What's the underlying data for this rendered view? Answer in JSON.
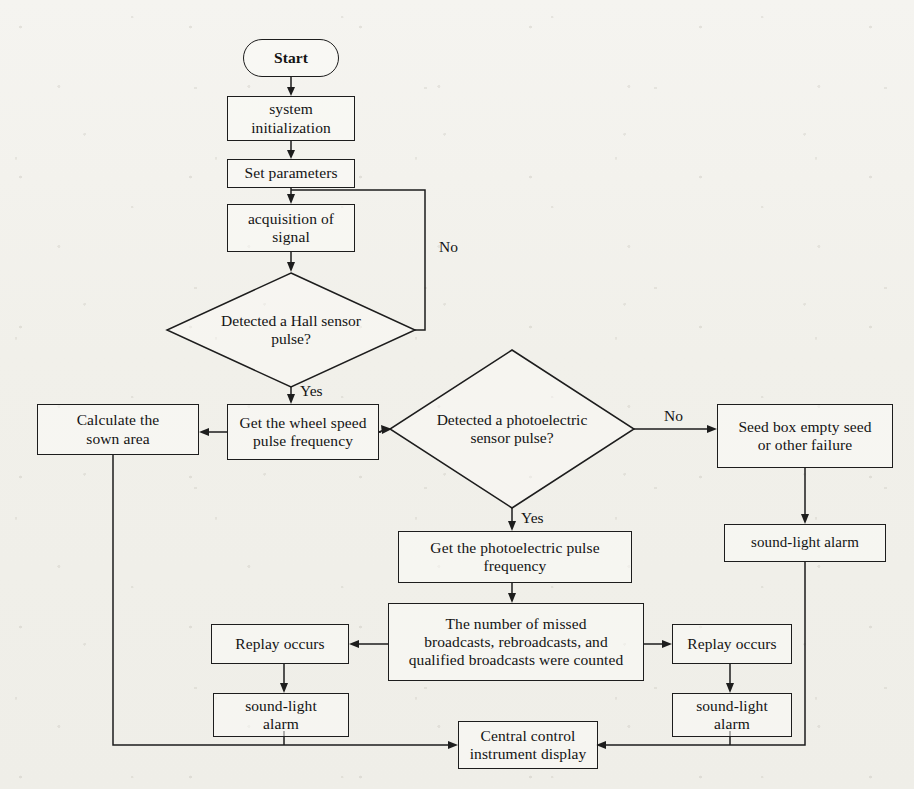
{
  "diagram": {
    "line_color": "#1d1d1d",
    "background_color": "#f3f2ee",
    "nodes": {
      "start": "Start",
      "system_init": "system\ninitialization",
      "set_parameters": "Set  parameters",
      "acquisition": "acquisition of\nsignal",
      "hall_decision": "Detected a Hall sensor\npulse?",
      "wheel_speed": "Get the wheel speed\npulse frequency",
      "calculate_area": "Calculate the\nsown area",
      "photo_decision": "Detected a photoelectric\nsensor pulse?",
      "seed_box_fail": "Seed box empty seed\nor other failure",
      "alarm_right_top": "sound-light alarm",
      "photo_pulse_freq": "Get the photoelectric pulse\nfrequency",
      "counted": "The number of missed\nbroadcasts, rebroadcasts, and\nqualified broadcasts were counted",
      "replay_left": "Replay occurs",
      "replay_right": "Replay occurs",
      "alarm_left": "sound-light\nalarm",
      "alarm_right": "sound-light\nalarm",
      "central_display": "Central control\ninstrument display"
    },
    "edge_labels": {
      "hall_no": "No",
      "hall_yes": "Yes",
      "photo_no": "No",
      "photo_yes": "Yes"
    }
  }
}
